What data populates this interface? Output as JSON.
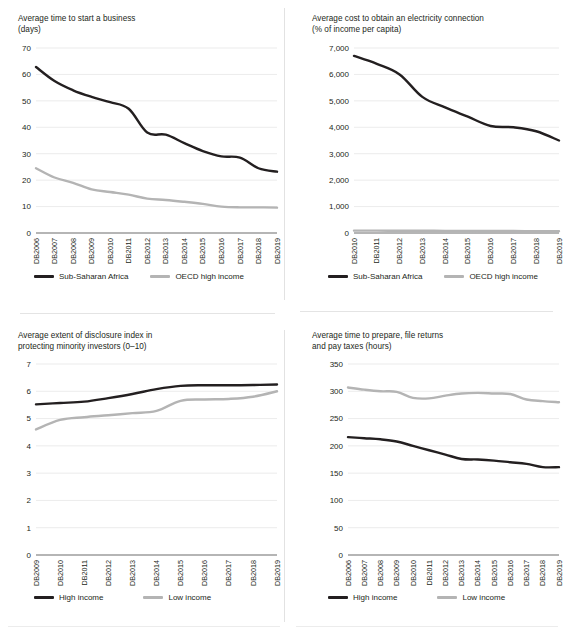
{
  "figure": {
    "background": "#ffffff",
    "colors": {
      "dark_series": "#231f20",
      "light_series": "#b4b4b4",
      "gridline": "#e3e3e3",
      "axis": "#6d6d6d"
    }
  },
  "charts": [
    {
      "id": "time-to-start-business",
      "title": "Average time to start a business\n(days)",
      "legend": [
        {
          "label": "Sub-Saharan Africa",
          "color": "#231f20"
        },
        {
          "label": "OECD high income",
          "color": "#b4b4b4"
        }
      ]
    },
    {
      "id": "cost-electricity-connection",
      "title": "Average cost to obtain an electricity connection\n(% of income per capita)",
      "legend": [
        {
          "label": "Sub-Saharan Africa",
          "color": "#231f20"
        },
        {
          "label": "OECD high income",
          "color": "#b4b4b4"
        }
      ]
    },
    {
      "id": "disclosure-index",
      "title": "Average extent of disclosure index in\nprotecting minority investors (0–10)",
      "legend": [
        {
          "label": "High income",
          "color": "#231f20"
        },
        {
          "label": "Low income",
          "color": "#b4b4b4"
        }
      ]
    },
    {
      "id": "time-to-pay-taxes",
      "title": "Average time to prepare, file returns\nand pay taxes (hours)",
      "legend": [
        {
          "label": "High income",
          "color": "#231f20"
        },
        {
          "label": "Low income",
          "color": "#b4b4b4"
        }
      ]
    }
  ],
  "chart_data": [
    {
      "type": "line",
      "id": "time-to-start-business",
      "title": "Average time to start a business (days)",
      "xlabel": "",
      "ylabel": "days",
      "ylim": [
        0,
        70
      ],
      "yticks": [
        0,
        10,
        20,
        30,
        40,
        50,
        60,
        70
      ],
      "ytick_labels": [
        "0",
        "10",
        "20",
        "30",
        "40",
        "50",
        "60",
        "70"
      ],
      "grid": true,
      "legend_position": "bottom",
      "categories": [
        "DB2006",
        "DB2007",
        "DB2008",
        "DB2009",
        "DB2010",
        "DB2011",
        "DB2012",
        "DB2013",
        "DB2014",
        "DB2015",
        "DB2016",
        "DB2017",
        "DB2018",
        "DB2019"
      ],
      "series": [
        {
          "name": "Sub-Saharan Africa",
          "color": "#231f20",
          "values": [
            62.8,
            57.5,
            54.0,
            51.5,
            49.5,
            47.0,
            38.0,
            37.2,
            34.0,
            31.0,
            29.0,
            28.5,
            24.5,
            23.2
          ]
        },
        {
          "name": "OECD high income",
          "color": "#b4b4b4",
          "values": [
            24.5,
            21.0,
            19.0,
            16.5,
            15.5,
            14.5,
            13.0,
            12.5,
            11.8,
            11.0,
            10.0,
            9.7,
            9.7,
            9.6
          ]
        }
      ]
    },
    {
      "type": "line",
      "id": "cost-electricity-connection",
      "title": "Average cost to obtain an electricity connection (% of income per capita)",
      "xlabel": "",
      "ylabel": "% of income per capita",
      "ylim": [
        0,
        7000
      ],
      "yticks": [
        0,
        1000,
        2000,
        3000,
        4000,
        5000,
        6000,
        7000
      ],
      "ytick_labels": [
        "0",
        "1,000",
        "2,000",
        "3,000",
        "4,000",
        "5,000",
        "6,000",
        "7,000"
      ],
      "grid": true,
      "legend_position": "bottom",
      "categories": [
        "DB2010",
        "DB2011",
        "DB2012",
        "DB2013",
        "DB2014",
        "DB2015",
        "DB2016",
        "DB2017",
        "DB2018",
        "DB2019"
      ],
      "series": [
        {
          "name": "Sub-Saharan Africa",
          "color": "#231f20",
          "values": [
            6700,
            6400,
            6000,
            5150,
            4750,
            4400,
            4050,
            4000,
            3850,
            3500
          ]
        },
        {
          "name": "OECD high income",
          "color": "#b4b4b4",
          "values": [
            90,
            90,
            85,
            85,
            80,
            80,
            75,
            75,
            70,
            70
          ]
        }
      ]
    },
    {
      "type": "line",
      "id": "disclosure-index",
      "title": "Average extent of disclosure index in protecting minority investors (0–10)",
      "xlabel": "",
      "ylabel": "index (0–10)",
      "ylim": [
        0,
        7
      ],
      "yticks": [
        0,
        1,
        2,
        3,
        4,
        5,
        6,
        7
      ],
      "ytick_labels": [
        "0",
        "1",
        "2",
        "3",
        "4",
        "5",
        "6",
        "7"
      ],
      "grid": true,
      "legend_position": "bottom",
      "categories": [
        "DB2009",
        "DB2010",
        "DB2011",
        "DB2012",
        "DB2013",
        "DB2014",
        "DB2015",
        "DB2016",
        "DB2017",
        "DB2018",
        "DB2019"
      ],
      "series": [
        {
          "name": "High income",
          "color": "#231f20",
          "values": [
            5.52,
            5.57,
            5.62,
            5.75,
            5.9,
            6.08,
            6.2,
            6.22,
            6.22,
            6.23,
            6.25
          ]
        },
        {
          "name": "Low income",
          "color": "#b4b4b4",
          "values": [
            4.6,
            4.95,
            5.05,
            5.12,
            5.2,
            5.28,
            5.65,
            5.7,
            5.72,
            5.8,
            6.0
          ]
        }
      ]
    },
    {
      "type": "line",
      "id": "time-to-pay-taxes",
      "title": "Average time to prepare, file returns and pay taxes (hours)",
      "xlabel": "",
      "ylabel": "hours",
      "ylim": [
        0,
        350
      ],
      "yticks": [
        0,
        50,
        100,
        150,
        200,
        250,
        300,
        350
      ],
      "ytick_labels": [
        "0",
        "50",
        "100",
        "150",
        "200",
        "250",
        "300",
        "350"
      ],
      "grid": true,
      "legend_position": "bottom",
      "categories": [
        "DB2006",
        "DB2007",
        "DB2008",
        "DB2009",
        "DB2010",
        "DB2011",
        "DB2012",
        "DB2013",
        "DB2014",
        "DB2015",
        "DB2016",
        "DB2017",
        "DB2018",
        "DB2019"
      ],
      "series": [
        {
          "name": "High income",
          "color": "#231f20",
          "values": [
            216,
            214,
            212,
            208,
            200,
            192,
            184,
            176,
            175,
            173,
            170,
            167,
            161,
            161
          ]
        },
        {
          "name": "Low income",
          "color": "#b4b4b4",
          "values": [
            307,
            303,
            300,
            299,
            288,
            287,
            292,
            296,
            297,
            296,
            295,
            285,
            282,
            280
          ]
        }
      ]
    }
  ]
}
